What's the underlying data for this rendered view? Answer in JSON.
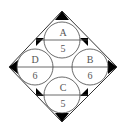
{
  "diagram": {
    "colors": {
      "stroke": "#333333",
      "fill_black": "#000000",
      "background": "#ffffff",
      "text": "#555555"
    },
    "circles": [
      {
        "id": "A",
        "letter": "A",
        "number": "5",
        "position": "top"
      },
      {
        "id": "B",
        "letter": "B",
        "number": "6",
        "position": "right"
      },
      {
        "id": "C",
        "letter": "C",
        "number": "5",
        "position": "bottom"
      },
      {
        "id": "D",
        "letter": "D",
        "number": "6",
        "position": "left"
      }
    ]
  }
}
